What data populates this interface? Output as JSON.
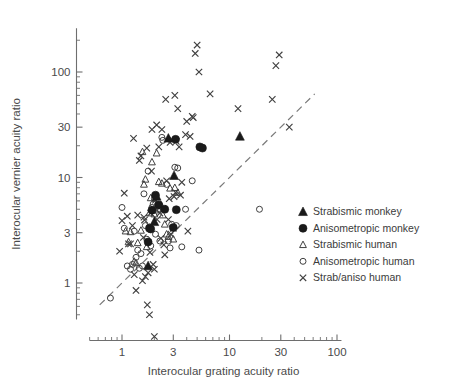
{
  "chart_data": {
    "type": "scatter",
    "title": "",
    "xlabel": "Interocular grating acuity ratio",
    "ylabel": "Interocular vernier acuity ratio",
    "xscale": "log",
    "yscale": "log",
    "xlim": [
      0.5,
      110
    ],
    "ylim": [
      0.45,
      260
    ],
    "grid": false,
    "legend_position": "right",
    "xticks": [
      1,
      3,
      10,
      30,
      100
    ],
    "xticklabels": [
      "1",
      "3",
      "10",
      "30",
      "100"
    ],
    "yticks": [
      1,
      3,
      10,
      30,
      100
    ],
    "yticklabels": [
      "1",
      "3",
      "10",
      "30",
      "100"
    ],
    "reference_line": {
      "name": "unity-line",
      "style": "dashed",
      "from": [
        0.62,
        0.62
      ],
      "to": [
        62,
        62
      ]
    },
    "series": [
      {
        "name": "Strabismic monkey",
        "marker": "filled-triangle",
        "color": "#1a1a1a",
        "points": [
          [
            1.75,
            1.45
          ],
          [
            2.0,
            3.8
          ],
          [
            2.1,
            6.6
          ],
          [
            2.7,
            23.5
          ],
          [
            3.05,
            10.4
          ],
          [
            12.5,
            24.5
          ]
        ]
      },
      {
        "name": "Anisometropic monkey",
        "marker": "filled-circle",
        "color": "#1a1a1a",
        "points": [
          [
            1.75,
            2.45
          ],
          [
            1.8,
            3.3
          ],
          [
            1.85,
            3.25
          ],
          [
            1.9,
            4.9
          ],
          [
            2.05,
            6.8
          ],
          [
            2.2,
            5.5
          ],
          [
            2.5,
            5.0
          ],
          [
            3.0,
            3.35
          ],
          [
            3.15,
            23.0
          ],
          [
            3.2,
            4.95
          ],
          [
            5.3,
            19.5
          ],
          [
            5.6,
            19.0
          ]
        ]
      },
      {
        "name": "Strabismic human",
        "marker": "open-triangle",
        "color": "#404040",
        "points": [
          [
            1.08,
            3.1
          ],
          [
            1.15,
            2.45
          ],
          [
            1.2,
            3.05
          ],
          [
            1.3,
            1.6
          ],
          [
            1.35,
            1.55
          ],
          [
            1.4,
            2.4
          ],
          [
            1.5,
            3.15
          ],
          [
            1.55,
            17.5
          ],
          [
            1.6,
            8.6
          ],
          [
            1.65,
            9.6
          ],
          [
            1.7,
            2.2
          ],
          [
            1.8,
            4.6
          ],
          [
            1.85,
            6.4
          ],
          [
            1.9,
            14.0
          ],
          [
            2.0,
            4.5
          ],
          [
            2.05,
            4.9
          ],
          [
            2.1,
            17.0
          ],
          [
            2.2,
            9.1
          ],
          [
            2.3,
            5.5
          ],
          [
            2.35,
            8.8
          ],
          [
            2.4,
            4.4
          ],
          [
            2.5,
            3.6
          ],
          [
            2.6,
            2.9
          ],
          [
            2.7,
            2.75
          ],
          [
            2.8,
            7.9
          ],
          [
            3.0,
            2.6
          ],
          [
            3.1,
            8.0
          ],
          [
            3.3,
            7.2
          ]
        ]
      },
      {
        "name": "Anisometropic human",
        "marker": "open-circle",
        "color": "#404040",
        "points": [
          [
            0.78,
            0.72
          ],
          [
            1.0,
            5.2
          ],
          [
            1.05,
            3.3
          ],
          [
            1.12,
            1.45
          ],
          [
            1.2,
            1.35
          ],
          [
            1.25,
            1.5
          ],
          [
            1.3,
            3.1
          ],
          [
            1.35,
            1.75
          ],
          [
            1.4,
            2.05
          ],
          [
            1.45,
            1.38
          ],
          [
            1.5,
            1.9
          ],
          [
            1.55,
            1.45
          ],
          [
            1.6,
            7.0
          ],
          [
            1.65,
            3.5
          ],
          [
            1.7,
            2.6
          ],
          [
            1.75,
            11.5
          ],
          [
            1.8,
            3.4
          ],
          [
            1.85,
            2.25
          ],
          [
            1.9,
            5.2
          ],
          [
            1.95,
            5.6
          ],
          [
            2.0,
            6.3
          ],
          [
            2.05,
            2.9
          ],
          [
            2.1,
            5.3
          ],
          [
            2.2,
            5.0
          ],
          [
            2.25,
            2.5
          ],
          [
            2.35,
            24.0
          ],
          [
            2.4,
            22.5
          ],
          [
            2.5,
            5.0
          ],
          [
            2.6,
            8.6
          ],
          [
            2.7,
            2.5
          ],
          [
            2.8,
            2.15
          ],
          [
            2.9,
            3.6
          ],
          [
            3.1,
            12.5
          ],
          [
            3.2,
            3.5
          ],
          [
            3.3,
            12.3
          ],
          [
            3.6,
            2.2
          ],
          [
            3.9,
            5.0
          ],
          [
            4.5,
            9.3
          ],
          [
            5.2,
            2.05
          ],
          [
            19.0,
            5.0
          ]
        ]
      },
      {
        "name": "Strab/aniso human",
        "marker": "cross",
        "color": "#404040",
        "points": [
          [
            0.95,
            2.0
          ],
          [
            1.0,
            3.9
          ],
          [
            1.05,
            7.1
          ],
          [
            1.12,
            4.3
          ],
          [
            1.15,
            2.35
          ],
          [
            1.2,
            2.35
          ],
          [
            1.25,
            3.5
          ],
          [
            1.28,
            23.5
          ],
          [
            1.3,
            1.2
          ],
          [
            1.35,
            0.85
          ],
          [
            1.4,
            4.4
          ],
          [
            1.45,
            14.5
          ],
          [
            1.5,
            16.0
          ],
          [
            1.55,
            1.05
          ],
          [
            1.58,
            2.7
          ],
          [
            1.6,
            4.2
          ],
          [
            1.62,
            3.95
          ],
          [
            1.65,
            1.15
          ],
          [
            1.7,
            19.0
          ],
          [
            1.72,
            0.62
          ],
          [
            1.75,
            1.25
          ],
          [
            1.8,
            0.5
          ],
          [
            1.82,
            1.95
          ],
          [
            1.85,
            4.6
          ],
          [
            1.88,
            11.5
          ],
          [
            1.9,
            28.5
          ],
          [
            1.95,
            1.5
          ],
          [
            2.0,
            1.35
          ],
          [
            2.05,
            6.1
          ],
          [
            2.1,
            31.5
          ],
          [
            2.12,
            4.0
          ],
          [
            2.15,
            5.3
          ],
          [
            2.2,
            19.5
          ],
          [
            2.25,
            4.6
          ],
          [
            2.3,
            2.65
          ],
          [
            2.35,
            28.5
          ],
          [
            2.4,
            5.1
          ],
          [
            2.45,
            2.3
          ],
          [
            2.5,
            1.85
          ],
          [
            2.55,
            55.0
          ],
          [
            2.6,
            9.3
          ],
          [
            2.7,
            4.0
          ],
          [
            2.75,
            6.3
          ],
          [
            2.8,
            21.5
          ],
          [
            2.85,
            2.9
          ],
          [
            2.9,
            23.0
          ],
          [
            3.0,
            3.3
          ],
          [
            3.05,
            6.6
          ],
          [
            3.1,
            60.0
          ],
          [
            3.15,
            7.2
          ],
          [
            3.2,
            22.0
          ],
          [
            3.3,
            45.0
          ],
          [
            3.4,
            19.5
          ],
          [
            3.5,
            6.8
          ],
          [
            3.6,
            9.0
          ],
          [
            3.9,
            25.5
          ],
          [
            4.0,
            34.0
          ],
          [
            4.1,
            3.1
          ],
          [
            4.3,
            24.5
          ],
          [
            4.5,
            38.0
          ],
          [
            4.6,
            37.0
          ],
          [
            4.8,
            150.0
          ],
          [
            5.0,
            180.0
          ],
          [
            5.2,
            100.0
          ],
          [
            6.6,
            62.0
          ],
          [
            12.0,
            45.0
          ],
          [
            25.0,
            55.0
          ],
          [
            27.0,
            115.0
          ],
          [
            29.0,
            145.0
          ],
          [
            36.0,
            30.0
          ]
        ]
      }
    ],
    "below_axis_outlier": {
      "series": "Strab/aniso human",
      "marker": "cross",
      "x": 2.0,
      "note": "plotted below the x-axis line"
    }
  },
  "legend": {
    "items": [
      {
        "label": "Strabismic monkey",
        "marker": "filled-triangle"
      },
      {
        "label": "Anisometropic monkey",
        "marker": "filled-circle"
      },
      {
        "label": "Strabismic human",
        "marker": "open-triangle"
      },
      {
        "label": "Anisometropic human",
        "marker": "open-circle"
      },
      {
        "label": "Strab/aniso human",
        "marker": "cross"
      }
    ]
  }
}
